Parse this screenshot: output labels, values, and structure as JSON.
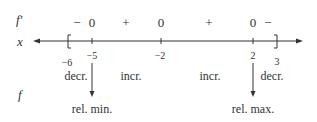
{
  "labels": {
    "f_prime": "f′",
    "x": "x",
    "f": "f"
  },
  "sign_row": [
    {
      "text": "−",
      "x": 77
    },
    {
      "text": "0",
      "x": 92
    },
    {
      "text": "+",
      "x": 126
    },
    {
      "text": "0",
      "x": 161
    },
    {
      "text": "+",
      "x": 209
    },
    {
      "text": "0",
      "x": 253
    },
    {
      "text": "−",
      "x": 268
    }
  ],
  "axis": {
    "left_bracket": "[",
    "right_bracket": "]",
    "tick_labels": [
      {
        "text": "−6",
        "x": 68
      },
      {
        "text": "−5",
        "x": 92
      },
      {
        "text": "−2",
        "x": 161
      },
      {
        "text": "2",
        "x": 253
      },
      {
        "text": "3",
        "x": 277
      }
    ]
  },
  "behavior": [
    {
      "text": "decr.",
      "x": 76
    },
    {
      "text": "incr.",
      "x": 131
    },
    {
      "text": "incr.",
      "x": 210
    },
    {
      "text": "decr.",
      "x": 272
    }
  ],
  "extrema": [
    {
      "text": "rel. min.",
      "x": 92
    },
    {
      "text": "rel. max.",
      "x": 253
    }
  ],
  "colors": {
    "ink": "#333333"
  }
}
